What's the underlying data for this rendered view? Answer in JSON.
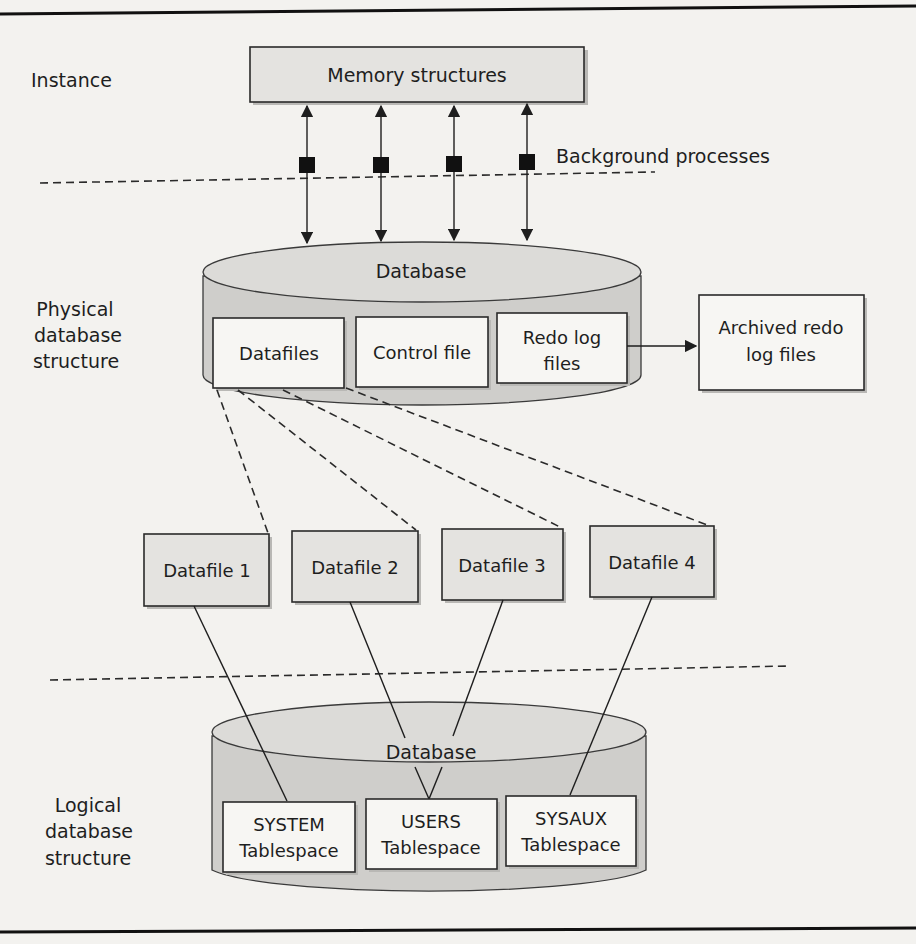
{
  "diagram": {
    "sections": {
      "instance": "Instance",
      "physical": [
        "Physical",
        "database",
        "structure"
      ],
      "logical": [
        "Logical",
        "database",
        "structure"
      ]
    },
    "instance": {
      "memory_structures": "Memory structures",
      "background_processes": "Background processes",
      "process_count": 4
    },
    "physical_database": {
      "cylinder_label": "Database",
      "files": [
        {
          "label": [
            "Datafiles"
          ]
        },
        {
          "label": [
            "Control file"
          ]
        },
        {
          "label": [
            "Redo log",
            "files"
          ]
        }
      ],
      "archived": [
        "Archived redo",
        "log files"
      ]
    },
    "datafiles": [
      {
        "label": "Datafile 1"
      },
      {
        "label": "Datafile 2"
      },
      {
        "label": "Datafile 3"
      },
      {
        "label": "Datafile 4"
      }
    ],
    "logical_database": {
      "cylinder_label": "Database",
      "tablespaces": [
        {
          "label": [
            "SYSTEM",
            "Tablespace"
          ]
        },
        {
          "label": [
            "USERS",
            "Tablespace"
          ]
        },
        {
          "label": [
            "SYSAUX",
            "Tablespace"
          ]
        }
      ]
    },
    "edges": [
      {
        "from": "Memory structures",
        "to": "Database (physical)",
        "type": "bidirectional",
        "count": 4
      },
      {
        "from": "Redo log files",
        "to": "Archived redo log files",
        "type": "arrow"
      },
      {
        "from": "Datafiles",
        "to": "Datafile 1",
        "type": "dashed"
      },
      {
        "from": "Datafiles",
        "to": "Datafile 2",
        "type": "dashed"
      },
      {
        "from": "Datafiles",
        "to": "Datafile 3",
        "type": "dashed"
      },
      {
        "from": "Datafiles",
        "to": "Datafile 4",
        "type": "dashed"
      },
      {
        "from": "Datafile 1",
        "to": "SYSTEM Tablespace",
        "type": "line"
      },
      {
        "from": "Datafile 2",
        "to": "USERS Tablespace",
        "type": "line"
      },
      {
        "from": "Datafile 3",
        "to": "USERS Tablespace",
        "type": "line"
      },
      {
        "from": "Datafile 4",
        "to": "SYSAUX Tablespace",
        "type": "line"
      }
    ],
    "colors": {
      "page": "#f3f2ef",
      "cylinder": "#cfcecb",
      "box": "#f7f6f3",
      "ink": "#1e1e1e"
    }
  }
}
